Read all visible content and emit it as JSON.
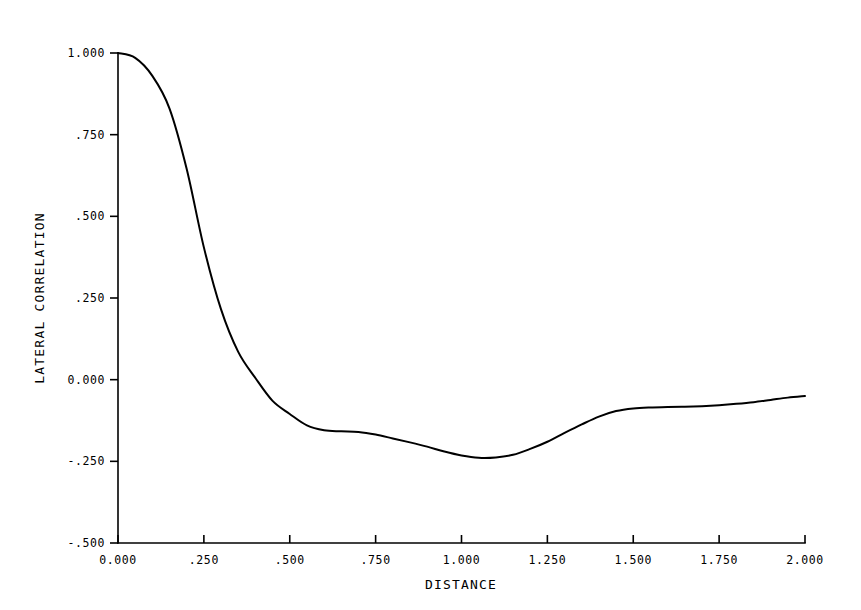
{
  "chart_data": {
    "type": "line",
    "title": "",
    "xlabel": "DISTANCE",
    "ylabel": "LATERAL CORRELATION",
    "xlim": [
      0.0,
      2.0
    ],
    "ylim": [
      -0.5,
      1.0
    ],
    "grid": false,
    "legend": null,
    "x_tick_labels": [
      "0.000",
      ".250",
      ".500",
      ".750",
      "1.000",
      "1.250",
      "1.500",
      "1.750",
      "2.000"
    ],
    "x_tick_values": [
      0.0,
      0.25,
      0.5,
      0.75,
      1.0,
      1.25,
      1.5,
      1.75,
      2.0
    ],
    "y_tick_labels": [
      "1.000",
      ".750",
      ".500",
      ".250",
      "0.000",
      "-.250",
      "-.500"
    ],
    "y_tick_values": [
      1.0,
      0.75,
      0.5,
      0.25,
      0.0,
      -0.25,
      -0.5
    ],
    "series": [
      {
        "name": "lateral correlation",
        "color": "#000000",
        "x": [
          0.0,
          0.05,
          0.1,
          0.15,
          0.2,
          0.25,
          0.3,
          0.35,
          0.4,
          0.45,
          0.5,
          0.55,
          0.6,
          0.65,
          0.7,
          0.75,
          0.8,
          0.85,
          0.9,
          0.95,
          1.0,
          1.05,
          1.1,
          1.15,
          1.2,
          1.25,
          1.3,
          1.35,
          1.4,
          1.45,
          1.5,
          1.55,
          1.6,
          1.65,
          1.7,
          1.75,
          1.8,
          1.85,
          1.9,
          1.95,
          2.0
        ],
        "y": [
          1.0,
          0.985,
          0.93,
          0.83,
          0.645,
          0.405,
          0.215,
          0.085,
          0.005,
          -0.065,
          -0.105,
          -0.14,
          -0.155,
          -0.158,
          -0.16,
          -0.168,
          -0.18,
          -0.192,
          -0.205,
          -0.22,
          -0.232,
          -0.239,
          -0.238,
          -0.23,
          -0.212,
          -0.19,
          -0.163,
          -0.137,
          -0.113,
          -0.096,
          -0.088,
          -0.085,
          -0.084,
          -0.083,
          -0.081,
          -0.078,
          -0.074,
          -0.069,
          -0.062,
          -0.055,
          -0.05
        ]
      }
    ]
  },
  "axis": {
    "x_title": "DISTANCE",
    "y_title": "LATERAL CORRELATION"
  },
  "colors": {
    "background": "#ffffff",
    "ink": "#000000",
    "curve": "#000000"
  }
}
